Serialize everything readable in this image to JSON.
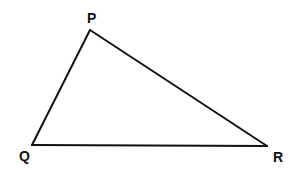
{
  "diagram": {
    "type": "triangle",
    "colors": {
      "stroke": "#111111",
      "background": "#ffffff",
      "label": "#111111"
    },
    "vertices": [
      {
        "id": "P",
        "label": "P",
        "x": 90,
        "y": 30,
        "label_x": 87,
        "label_y": 23
      },
      {
        "id": "Q",
        "label": "Q",
        "x": 32,
        "y": 145,
        "label_x": 19,
        "label_y": 161
      },
      {
        "id": "R",
        "label": "R",
        "x": 267,
        "y": 146,
        "label_x": 273,
        "label_y": 162
      }
    ],
    "edges": [
      {
        "from": "P",
        "to": "Q",
        "name": "PQ"
      },
      {
        "from": "Q",
        "to": "R",
        "name": "QR"
      },
      {
        "from": "R",
        "to": "P",
        "name": "RP"
      }
    ]
  }
}
